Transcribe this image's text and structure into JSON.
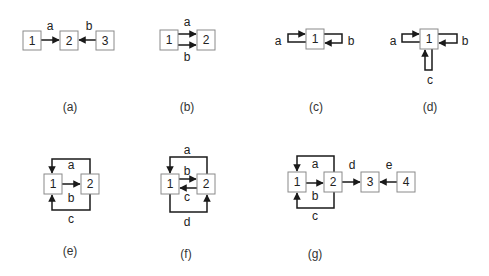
{
  "diagrams": [
    {
      "id": "a",
      "caption": "(a)",
      "nodes": [
        {
          "label": "1",
          "x": 23,
          "y": 31
        },
        {
          "label": "2",
          "x": 60,
          "y": 31
        },
        {
          "label": "3",
          "x": 96,
          "y": 31
        }
      ],
      "edges": [
        {
          "label": "a",
          "from": "1",
          "to": "2",
          "lx": 50,
          "ly": 26
        },
        {
          "label": "b",
          "from": "3",
          "to": "2",
          "lx": 89,
          "ly": 26
        }
      ],
      "caption_pos": {
        "x": 70,
        "y": 107
      }
    },
    {
      "id": "b",
      "caption": "(b)",
      "nodes": [
        {
          "label": "1",
          "x": 160,
          "y": 30
        },
        {
          "label": "2",
          "x": 197,
          "y": 30
        }
      ],
      "edges": [
        {
          "label": "a",
          "from": "1",
          "to": "2",
          "lx": 187,
          "ly": 22
        },
        {
          "label": "b",
          "from": "1",
          "to": "2",
          "lx": 187,
          "ly": 57
        }
      ],
      "caption_pos": {
        "x": 187,
        "y": 107
      }
    },
    {
      "id": "c",
      "caption": "(c)",
      "nodes": [
        {
          "label": "1",
          "x": 306,
          "y": 29
        }
      ],
      "edges": [
        {
          "label": "a",
          "from": "external",
          "to": "1",
          "lx": 278,
          "ly": 41
        },
        {
          "label": "b",
          "from": "external",
          "to": "1",
          "lx": 351,
          "ly": 41
        }
      ],
      "caption_pos": {
        "x": 316,
        "y": 107
      }
    },
    {
      "id": "d",
      "caption": "(d)",
      "nodes": [
        {
          "label": "1",
          "x": 420,
          "y": 29
        }
      ],
      "edges": [
        {
          "label": "a",
          "from": "external",
          "to": "1",
          "lx": 393,
          "ly": 41
        },
        {
          "label": "b",
          "from": "external",
          "to": "1",
          "lx": 465,
          "ly": 41
        },
        {
          "label": "c",
          "from": "external",
          "to": "1",
          "lx": 430,
          "ly": 80
        }
      ],
      "caption_pos": {
        "x": 430,
        "y": 107
      }
    },
    {
      "id": "e",
      "caption": "(e)",
      "nodes": [
        {
          "label": "1",
          "x": 44,
          "y": 174
        },
        {
          "label": "2",
          "x": 81,
          "y": 174
        }
      ],
      "edges": [
        {
          "label": "a",
          "from": "2",
          "to": "1",
          "lx": 71,
          "ly": 165
        },
        {
          "label": "b",
          "from": "1",
          "to": "2",
          "lx": 71,
          "ly": 198
        },
        {
          "label": "c",
          "from": "2",
          "to": "1",
          "lx": 71,
          "ly": 219
        }
      ],
      "caption_pos": {
        "x": 70,
        "y": 251
      }
    },
    {
      "id": "f",
      "caption": "(f)",
      "nodes": [
        {
          "label": "1",
          "x": 161,
          "y": 174
        },
        {
          "label": "2",
          "x": 197,
          "y": 174
        }
      ],
      "edges": [
        {
          "label": "a",
          "from": "2",
          "to": "1",
          "lx": 187,
          "ly": 150
        },
        {
          "label": "b",
          "from": "1",
          "to": "2",
          "lx": 187,
          "ly": 171
        },
        {
          "label": "c",
          "from": "2",
          "to": "1",
          "lx": 187,
          "ly": 197
        },
        {
          "label": "d",
          "from": "1",
          "to": "2",
          "lx": 187,
          "ly": 222
        }
      ],
      "caption_pos": {
        "x": 186,
        "y": 254
      }
    },
    {
      "id": "g",
      "caption": "(g)",
      "nodes": [
        {
          "label": "1",
          "x": 288,
          "y": 172
        },
        {
          "label": "2",
          "x": 324,
          "y": 172
        },
        {
          "label": "3",
          "x": 361,
          "y": 172
        },
        {
          "label": "4",
          "x": 397,
          "y": 172
        }
      ],
      "edges": [
        {
          "label": "a",
          "from": "2",
          "to": "1",
          "lx": 315,
          "ly": 164
        },
        {
          "label": "b",
          "from": "1",
          "to": "2",
          "lx": 315,
          "ly": 196
        },
        {
          "label": "c",
          "from": "2",
          "to": "1",
          "lx": 315,
          "ly": 216
        },
        {
          "label": "d",
          "from": "2",
          "to": "3",
          "lx": 352,
          "ly": 165
        },
        {
          "label": "e",
          "from": "4",
          "to": "3",
          "lx": 389,
          "ly": 165
        }
      ],
      "caption_pos": {
        "x": 315,
        "y": 254
      }
    }
  ]
}
